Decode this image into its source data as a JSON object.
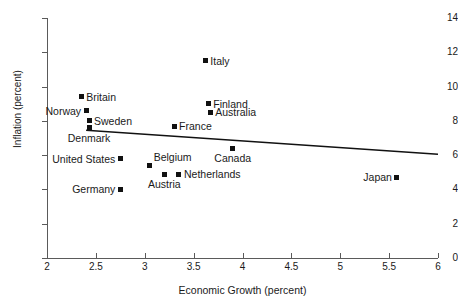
{
  "chart_data": {
    "type": "scatter",
    "title": "",
    "xlabel": "Economic Growth (percent)",
    "ylabel": "Inflation (percent)",
    "xlim": [
      2,
      6
    ],
    "ylim": [
      0,
      14
    ],
    "xticks": [
      "2",
      "2.5",
      "3",
      "3.5",
      "4",
      "4.5",
      "5",
      "5.5",
      "6"
    ],
    "xtick_values": [
      2,
      2.5,
      3,
      3.5,
      4,
      4.5,
      5,
      5.5,
      6
    ],
    "yticks": [
      "0",
      "2",
      "4",
      "6",
      "8",
      "10",
      "12",
      "14"
    ],
    "ytick_values": [
      0,
      2,
      4,
      6,
      8,
      10,
      12,
      14
    ],
    "grid": false,
    "legend": false,
    "points": [
      {
        "label": "Britain",
        "x": 2.35,
        "y": 9.4,
        "label_pos": "right"
      },
      {
        "label": "Norway",
        "x": 2.4,
        "y": 8.6,
        "label_pos": "left"
      },
      {
        "label": "Sweden",
        "x": 2.43,
        "y": 8.0,
        "label_pos": "right"
      },
      {
        "label": "Denmark",
        "x": 2.43,
        "y": 7.6,
        "label_pos": "below"
      },
      {
        "label": "Italy",
        "x": 3.62,
        "y": 11.5,
        "label_pos": "right"
      },
      {
        "label": "Finland",
        "x": 3.65,
        "y": 9.0,
        "label_pos": "right"
      },
      {
        "label": "Australia",
        "x": 3.67,
        "y": 8.5,
        "label_pos": "right"
      },
      {
        "label": "France",
        "x": 3.3,
        "y": 7.7,
        "label_pos": "right"
      },
      {
        "label": "United States",
        "x": 2.75,
        "y": 5.8,
        "label_pos": "left"
      },
      {
        "label": "Belgium",
        "x": 3.05,
        "y": 5.4,
        "label_pos": "above-right"
      },
      {
        "label": "Canada",
        "x": 3.9,
        "y": 6.4,
        "label_pos": "below"
      },
      {
        "label": "Austria",
        "x": 3.2,
        "y": 4.9,
        "label_pos": "below"
      },
      {
        "label": "Netherlands",
        "x": 3.35,
        "y": 4.9,
        "label_pos": "right"
      },
      {
        "label": "Germany",
        "x": 2.75,
        "y": 4.0,
        "label_pos": "left"
      },
      {
        "label": "Japan",
        "x": 5.58,
        "y": 4.7,
        "label_pos": "left"
      }
    ],
    "trend_line": {
      "name": "regression-line",
      "x0": 2.4,
      "y0": 7.45,
      "x1": 6.0,
      "y1": 6.05,
      "color": "#111111"
    },
    "marker": {
      "shape": "square",
      "color": "#111111",
      "size_px": 5
    }
  }
}
